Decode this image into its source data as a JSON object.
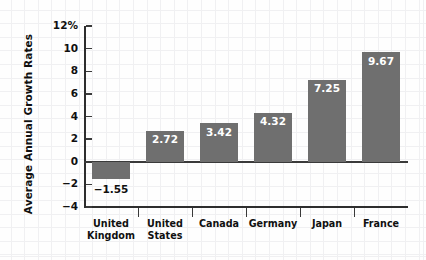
{
  "chart_data": {
    "type": "bar",
    "title": "",
    "xlabel": "",
    "ylabel": "Average Annual Growth Rates",
    "categories": [
      "United Kingdom",
      "United States",
      "Canada",
      "Germany",
      "Japan",
      "France"
    ],
    "values": [
      -1.55,
      2.72,
      3.42,
      4.32,
      7.25,
      9.67
    ],
    "value_labels": [
      "−1.55",
      "2.72",
      "3.42",
      "4.32",
      "7.25",
      "9.67"
    ],
    "ylim": [
      -4,
      12
    ],
    "yticks": [
      12,
      10,
      8,
      6,
      4,
      2,
      0,
      -2,
      -4
    ],
    "ytick_labels": [
      "12%",
      "10",
      "8",
      "6",
      "4",
      "2",
      "0",
      "−2",
      "−4"
    ],
    "grid": false,
    "legend": null,
    "bar_color": "#6f6f6f",
    "axis_color": "#2e2e2e",
    "text_color": "#101010",
    "inside_label_color": "#ffffff",
    "background": "#fefefe"
  }
}
